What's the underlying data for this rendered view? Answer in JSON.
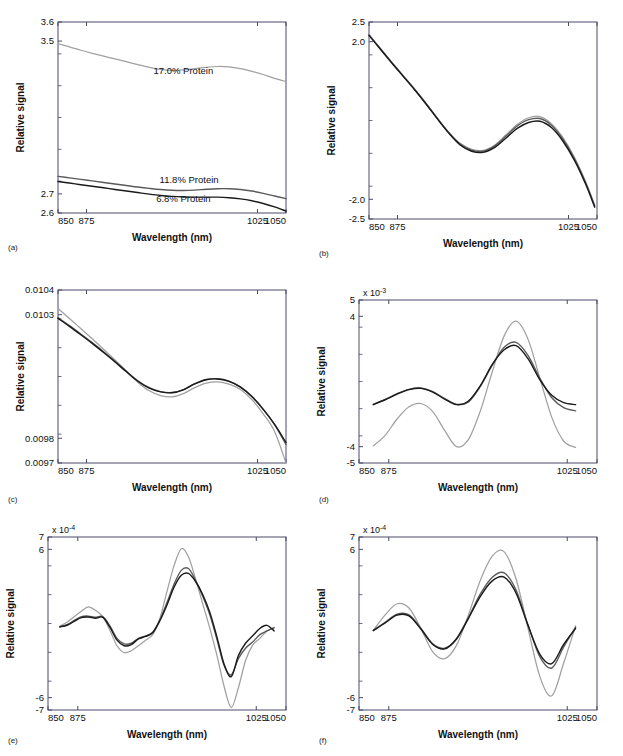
{
  "figure": {
    "background": "#ffffff",
    "panel_count": 6,
    "shared_xlabel": "Wavelength (nm)",
    "shared_ylabel": "Relative signal",
    "series_colors": {
      "light_gray": "#a9a9a9",
      "mid_gray": "#5a5a5a",
      "dark": "#1a1a1a"
    }
  },
  "captions": {
    "a": "(a)",
    "b": "(b)",
    "c": "(c)",
    "d": "(d)",
    "e": "(e)",
    "f": "(f)"
  },
  "chart_data": [
    {
      "id": "a",
      "type": "line",
      "title": "",
      "xlabel": "Wavelength (nm)",
      "ylabel": "Relative signal",
      "xlim": [
        850,
        1050
      ],
      "ylim": [
        2.6,
        3.6
      ],
      "xticks": [
        850,
        875,
        1025,
        1050
      ],
      "xticklabels": [
        "850",
        "875",
        "1025",
        "1050"
      ],
      "yticks": [
        2.6,
        2.7,
        3.5,
        3.6
      ],
      "yticklabels": [
        "2.6",
        "2.7",
        "3.5",
        "3.6"
      ],
      "exponent_label": "",
      "grid": false,
      "legend_position": "inline-annotations",
      "annotations": [
        {
          "text": "17.0% Protein",
          "x": 960,
          "y": 3.33
        },
        {
          "text": "11.8% Protein",
          "x": 965,
          "y": 2.755
        },
        {
          "text": "6.8% Protein",
          "x": 960,
          "y": 2.655
        }
      ],
      "x": [
        850,
        860,
        870,
        880,
        890,
        900,
        910,
        920,
        930,
        940,
        950,
        960,
        970,
        980,
        990,
        1000,
        1010,
        1020,
        1030,
        1040,
        1050
      ],
      "series": [
        {
          "name": "17.0% Protein",
          "color": "#a0a0a0",
          "values": [
            3.487,
            3.47,
            3.452,
            3.436,
            3.421,
            3.407,
            3.392,
            3.377,
            3.363,
            3.352,
            3.347,
            3.349,
            3.356,
            3.363,
            3.367,
            3.365,
            3.356,
            3.342,
            3.325,
            3.305,
            3.288
          ]
        },
        {
          "name": "11.8% Protein",
          "color": "#5a5a5a",
          "values": [
            2.792,
            2.784,
            2.776,
            2.768,
            2.76,
            2.752,
            2.744,
            2.736,
            2.729,
            2.723,
            2.719,
            2.718,
            2.72,
            2.724,
            2.727,
            2.727,
            2.723,
            2.715,
            2.703,
            2.689,
            2.675
          ]
        },
        {
          "name": "6.8% Protein",
          "color": "#1a1a1a",
          "values": [
            2.765,
            2.757,
            2.748,
            2.74,
            2.732,
            2.723,
            2.715,
            2.707,
            2.699,
            2.692,
            2.687,
            2.684,
            2.683,
            2.683,
            2.683,
            2.68,
            2.674,
            2.664,
            2.65,
            2.632,
            2.61
          ]
        }
      ]
    },
    {
      "id": "b",
      "type": "line",
      "title": "",
      "xlabel": "Wavelength (nm)",
      "ylabel": "Relative signal",
      "xlim": [
        850,
        1050
      ],
      "ylim": [
        -2.5,
        2.5
      ],
      "xticks": [
        850,
        875,
        1025,
        1050
      ],
      "xticklabels": [
        "850",
        "875",
        "1025",
        "1050"
      ],
      "yticks": [
        -2.5,
        -2.0,
        2.0,
        2.5
      ],
      "yticklabels": [
        "-2.5",
        "-2.0",
        "2.0",
        "2.5"
      ],
      "exponent_label": "",
      "grid": false,
      "legend_position": "none",
      "annotations": [],
      "x": [
        850,
        860,
        870,
        880,
        890,
        900,
        910,
        920,
        930,
        940,
        950,
        960,
        970,
        980,
        990,
        1000,
        1010,
        1020,
        1030,
        1040,
        1048
      ],
      "series": [
        {
          "name": "curve-1",
          "color": "#a0a0a0",
          "values": [
            2.18,
            1.83,
            1.48,
            1.14,
            0.8,
            0.44,
            0.06,
            -0.3,
            -0.58,
            -0.73,
            -0.76,
            -0.63,
            -0.37,
            -0.1,
            0.07,
            0.1,
            -0.08,
            -0.43,
            -0.92,
            -1.55,
            -2.15
          ]
        },
        {
          "name": "curve-2",
          "color": "#5a5a5a",
          "values": [
            2.17,
            1.82,
            1.47,
            1.13,
            0.79,
            0.43,
            0.05,
            -0.31,
            -0.6,
            -0.75,
            -0.78,
            -0.65,
            -0.4,
            -0.14,
            0.02,
            0.05,
            -0.12,
            -0.47,
            -0.96,
            -1.58,
            -2.17
          ]
        },
        {
          "name": "curve-3",
          "color": "#1a1a1a",
          "values": [
            2.16,
            1.81,
            1.46,
            1.12,
            0.78,
            0.42,
            0.04,
            -0.32,
            -0.62,
            -0.78,
            -0.81,
            -0.69,
            -0.45,
            -0.2,
            -0.05,
            -0.02,
            -0.18,
            -0.52,
            -1.0,
            -1.61,
            -2.2
          ]
        }
      ]
    },
    {
      "id": "c",
      "type": "line",
      "title": "",
      "xlabel": "Wavelength (nm)",
      "ylabel": "Relative signal",
      "xlim": [
        850,
        1050
      ],
      "ylim": [
        0.0097,
        0.0104
      ],
      "xticks": [
        850,
        875,
        1025,
        1050
      ],
      "xticklabels": [
        "850",
        "875",
        "1025",
        "1050"
      ],
      "yticks": [
        0.0097,
        0.0098,
        0.0103,
        0.0104
      ],
      "yticklabels": [
        "0.0097",
        "0.0098",
        "0.0103",
        "0.0104"
      ],
      "exponent_label": "",
      "grid": false,
      "legend_position": "none",
      "annotations": [],
      "x": [
        850,
        860,
        870,
        880,
        890,
        900,
        910,
        920,
        930,
        940,
        950,
        960,
        970,
        980,
        990,
        1000,
        1010,
        1020,
        1030,
        1040,
        1050
      ],
      "series": [
        {
          "name": "curve-1",
          "color": "#a0a0a0",
          "values": [
            0.010325,
            0.010285,
            0.010244,
            0.010203,
            0.01016,
            0.010117,
            0.010072,
            0.010027,
            0.009992,
            0.009973,
            0.009968,
            0.009981,
            0.010005,
            0.010023,
            0.010028,
            0.010019,
            0.009997,
            0.009957,
            0.009899,
            0.009827,
            0.0097
          ]
        },
        {
          "name": "curve-2",
          "color": "#5a5a5a",
          "values": [
            0.010288,
            0.010256,
            0.010222,
            0.010187,
            0.01015,
            0.010112,
            0.010071,
            0.010033,
            0.010005,
            0.009989,
            0.009985,
            0.009997,
            0.010021,
            0.010038,
            0.010041,
            0.010031,
            0.010008,
            0.00997,
            0.009918,
            0.009855,
            0.009775
          ]
        },
        {
          "name": "curve-3",
          "color": "#1a1a1a",
          "values": [
            0.010285,
            0.010253,
            0.010219,
            0.010184,
            0.010147,
            0.010109,
            0.010069,
            0.010031,
            0.010003,
            0.009988,
            0.009984,
            0.009996,
            0.01002,
            0.010037,
            0.01004,
            0.01003,
            0.010007,
            0.009969,
            0.009917,
            0.009856,
            0.009783
          ]
        }
      ]
    },
    {
      "id": "d",
      "type": "line",
      "title": "",
      "xlabel": "Wavelength (nm)",
      "ylabel": "Relative signal",
      "xlim": [
        850,
        1050
      ],
      "ylim": [
        -5,
        5
      ],
      "xticks": [
        850,
        875,
        1025,
        1050
      ],
      "xticklabels": [
        "850",
        "875",
        "1025",
        "1050"
      ],
      "yticks": [
        -5,
        -4,
        4,
        5
      ],
      "yticklabels": [
        "-5",
        "-4",
        "4",
        "5"
      ],
      "exponent_label": "x 10",
      "exponent_value": "-3",
      "grid": false,
      "legend_position": "none",
      "annotations": [],
      "x": [
        862,
        872,
        882,
        892,
        902,
        912,
        922,
        932,
        942,
        952,
        962,
        972,
        982,
        992,
        1002,
        1012,
        1022,
        1032
      ],
      "series": [
        {
          "name": "curve-1",
          "color": "#a0a0a0",
          "values": [
            -3.95,
            -3.3,
            -2.3,
            -1.55,
            -1.35,
            -1.85,
            -3.0,
            -4.0,
            -3.55,
            -1.8,
            0.6,
            2.8,
            3.7,
            2.6,
            0.2,
            -2.2,
            -3.65,
            -4.05
          ]
        },
        {
          "name": "curve-2",
          "color": "#5a5a5a",
          "values": [
            -1.4,
            -1.1,
            -0.75,
            -0.48,
            -0.4,
            -0.62,
            -1.05,
            -1.4,
            -1.25,
            -0.3,
            1.0,
            2.1,
            2.4,
            1.6,
            0.2,
            -1.0,
            -1.6,
            -1.8
          ]
        },
        {
          "name": "curve-3",
          "color": "#1a1a1a",
          "values": [
            -1.42,
            -1.12,
            -0.78,
            -0.5,
            -0.42,
            -0.65,
            -1.08,
            -1.42,
            -1.2,
            -0.25,
            1.05,
            1.95,
            2.2,
            1.4,
            0.1,
            -0.85,
            -1.3,
            -1.42
          ]
        }
      ]
    },
    {
      "id": "e",
      "type": "line",
      "title": "",
      "xlabel": "Wavelength (nm)",
      "ylabel": "Relative signal",
      "xlim": [
        850,
        1050
      ],
      "ylim": [
        -7,
        7
      ],
      "xticks": [
        850,
        875,
        1025,
        1050
      ],
      "xticklabels": [
        "850",
        "875",
        "1025",
        "1050"
      ],
      "yticks": [
        -7,
        -6,
        6,
        7
      ],
      "yticklabels": [
        "-7",
        "-6",
        "6",
        "7"
      ],
      "exponent_label": "x 10",
      "exponent_value": "-4",
      "grid": false,
      "legend_position": "none",
      "annotations": [],
      "x": [
        860,
        866,
        872,
        878,
        884,
        890,
        896,
        902,
        908,
        914,
        920,
        926,
        932,
        938,
        944,
        950,
        956,
        962,
        968,
        974,
        980,
        986,
        992,
        998,
        1004,
        1010,
        1016,
        1022,
        1028,
        1034,
        1040
      ],
      "series": [
        {
          "name": "curve-1",
          "color": "#a0a0a0",
          "values": [
            -0.2,
            0.1,
            0.55,
            1.0,
            1.35,
            1.05,
            0.55,
            -0.55,
            -1.8,
            -2.35,
            -2.2,
            -1.8,
            -1.35,
            -0.9,
            0.4,
            2.6,
            4.7,
            6.05,
            5.4,
            3.6,
            1.6,
            -0.4,
            -2.6,
            -5.1,
            -6.8,
            -5.2,
            -3.0,
            -1.75,
            -1.2,
            -0.6,
            -0.3
          ]
        },
        {
          "name": "curve-2",
          "color": "#5a5a5a",
          "values": [
            -0.25,
            -0.1,
            0.25,
            0.55,
            0.6,
            0.5,
            0.55,
            -0.2,
            -1.2,
            -1.65,
            -1.6,
            -1.2,
            -1.0,
            -0.7,
            0.3,
            1.7,
            3.2,
            4.3,
            4.45,
            3.5,
            2.2,
            0.7,
            -1.3,
            -3.4,
            -4.15,
            -2.85,
            -2.0,
            -1.5,
            -0.9,
            -0.6,
            -0.35
          ]
        },
        {
          "name": "curve-3",
          "color": "#1a1a1a",
          "values": [
            -0.28,
            -0.14,
            0.18,
            0.48,
            0.52,
            0.42,
            0.5,
            -0.3,
            -1.35,
            -1.8,
            -1.7,
            -1.25,
            -1.05,
            -0.75,
            0.22,
            1.5,
            2.95,
            3.9,
            4.05,
            3.4,
            2.35,
            0.9,
            -1.1,
            -3.3,
            -4.3,
            -2.6,
            -1.6,
            -1.0,
            -0.4,
            -0.15,
            -0.6
          ]
        }
      ]
    },
    {
      "id": "f",
      "type": "line",
      "title": "",
      "xlabel": "Wavelength (nm)",
      "ylabel": "Relative signal",
      "xlim": [
        850,
        1050
      ],
      "ylim": [
        -7,
        7
      ],
      "xticks": [
        850,
        875,
        1025,
        1050
      ],
      "xticklabels": [
        "850",
        "875",
        "1025",
        "1050"
      ],
      "yticks": [
        -7,
        -6,
        6,
        7
      ],
      "yticklabels": [
        "-7",
        "-6",
        "6",
        "7"
      ],
      "exponent_label": "x 10",
      "exponent_value": "-4",
      "grid": false,
      "legend_position": "none",
      "annotations": [],
      "x": [
        862,
        872,
        882,
        892,
        902,
        912,
        922,
        932,
        942,
        952,
        962,
        972,
        982,
        992,
        1002,
        1012,
        1022,
        1032
      ],
      "series": [
        {
          "name": "curve-1",
          "color": "#a0a0a0",
          "values": [
            -0.55,
            0.7,
            1.6,
            1.25,
            -0.4,
            -2.3,
            -2.85,
            -1.75,
            0.7,
            3.5,
            5.45,
            5.8,
            3.6,
            -0.4,
            -4.3,
            -5.85,
            -3.2,
            -0.2
          ]
        },
        {
          "name": "curve-2",
          "color": "#5a5a5a",
          "values": [
            -0.55,
            0.1,
            0.75,
            0.7,
            -0.4,
            -1.65,
            -2.0,
            -1.2,
            0.5,
            2.4,
            3.75,
            4.1,
            2.7,
            -0.1,
            -2.7,
            -3.6,
            -1.9,
            -0.3
          ]
        },
        {
          "name": "curve-3",
          "color": "#1a1a1a",
          "values": [
            -0.58,
            0.05,
            0.68,
            0.62,
            -0.45,
            -1.7,
            -2.05,
            -1.25,
            0.42,
            2.2,
            3.45,
            3.75,
            2.45,
            -0.15,
            -2.5,
            -3.25,
            -1.7,
            -0.4
          ]
        }
      ]
    }
  ]
}
